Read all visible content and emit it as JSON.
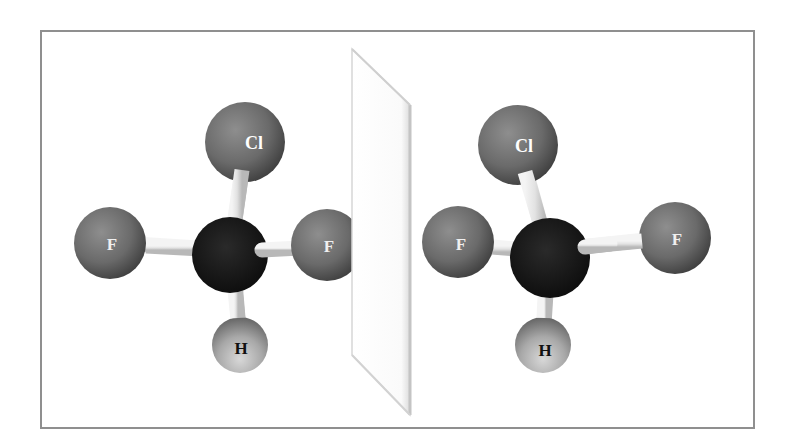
{
  "figure": {
    "frame_color": "#8f8f8f",
    "colors": {
      "halogen": "#6d6d6d",
      "carbon": "#161616",
      "hydrogen": "#9a9a9a",
      "bond": "#e6e6e6",
      "label_light": "#ffffff",
      "label_dark": "#111111"
    }
  },
  "mirror": {
    "label": "mirror plane",
    "points": [
      [
        352,
        49
      ],
      [
        410,
        105
      ],
      [
        410,
        415
      ],
      [
        352,
        355
      ]
    ]
  },
  "molecules": [
    {
      "name": "left-molecule",
      "atoms": [
        {
          "id": "Cl",
          "label": "Cl",
          "element": "chlorine",
          "x": 245,
          "y": 142,
          "r": 40
        },
        {
          "id": "F1",
          "label": "F",
          "element": "fluorine",
          "x": 110,
          "y": 243,
          "r": 36
        },
        {
          "id": "F2",
          "label": "F",
          "element": "fluorine",
          "x": 327,
          "y": 245,
          "r": 36
        },
        {
          "id": "C",
          "label": "",
          "element": "carbon",
          "x": 230,
          "y": 255,
          "r": 38
        },
        {
          "id": "H",
          "label": "H",
          "element": "hydrogen",
          "x": 240,
          "y": 345,
          "r": 28
        }
      ]
    },
    {
      "name": "right-molecule",
      "atoms": [
        {
          "id": "Cl",
          "label": "Cl",
          "element": "chlorine",
          "x": 518,
          "y": 145,
          "r": 40
        },
        {
          "id": "F1",
          "label": "F",
          "element": "fluorine",
          "x": 458,
          "y": 242,
          "r": 36
        },
        {
          "id": "F2",
          "label": "F",
          "element": "fluorine",
          "x": 675,
          "y": 238,
          "r": 36
        },
        {
          "id": "C",
          "label": "",
          "element": "carbon",
          "x": 550,
          "y": 258,
          "r": 40
        },
        {
          "id": "H",
          "label": "H",
          "element": "hydrogen",
          "x": 543,
          "y": 345,
          "r": 28
        }
      ]
    }
  ],
  "labels": {
    "left": {
      "cl": "Cl",
      "f1": "F",
      "f2": "F",
      "h": "H"
    },
    "right": {
      "cl": "Cl",
      "f1": "F",
      "f2": "F",
      "h": "H"
    }
  }
}
